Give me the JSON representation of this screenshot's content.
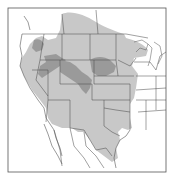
{
  "map": {
    "region": "Western and Central North America (USA, southern Canada, northern Mexico)",
    "colors": {
      "background": "#ffffff",
      "frame": "#555555",
      "boundary_lines": "#444444",
      "range_light": "#c8c8c8",
      "range_dark": "#9a9a9a"
    },
    "legend": []
  }
}
